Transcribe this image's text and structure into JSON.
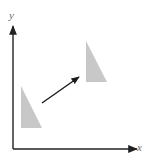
{
  "diagram": {
    "axes": {
      "x_label": "x",
      "y_label": "y",
      "origin": [
        13,
        149
      ],
      "x_end": [
        137,
        149
      ],
      "y_end": [
        13,
        26
      ],
      "color": "#222222"
    },
    "shapes": [
      {
        "name": "original-triangle",
        "points": [
          [
            21,
            86
          ],
          [
            21,
            128
          ],
          [
            42,
            128
          ]
        ],
        "fill": "#c8c8c8"
      },
      {
        "name": "translated-triangle",
        "points": [
          [
            86,
            41
          ],
          [
            86,
            82
          ],
          [
            107,
            82
          ]
        ],
        "fill": "#c8c8c8"
      }
    ],
    "translation_arrow": {
      "from": [
        42,
        103
      ],
      "to": [
        79,
        77
      ],
      "color": "#1a1a1a"
    }
  }
}
